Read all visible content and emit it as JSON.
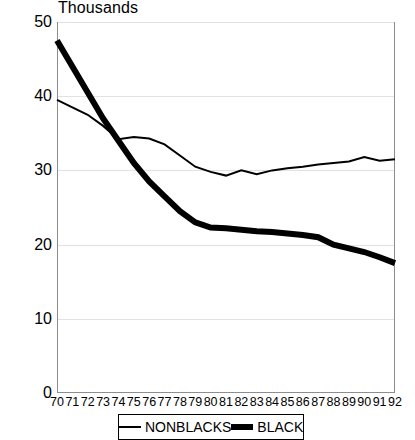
{
  "chart_data": {
    "type": "line",
    "title": "",
    "ylabel": "Thousands",
    "xlabel": "",
    "x": [
      70,
      71,
      72,
      73,
      74,
      75,
      76,
      77,
      78,
      79,
      80,
      81,
      82,
      83,
      84,
      85,
      86,
      87,
      88,
      89,
      90,
      91,
      92
    ],
    "xtick_labels": [
      "70",
      "71",
      "72",
      "73",
      "74",
      "75",
      "76",
      "77",
      "78",
      "79",
      "80",
      "81",
      "82",
      "83",
      "84",
      "85",
      "86",
      "87",
      "88",
      "89",
      "90",
      "91",
      "92"
    ],
    "ytick_labels": [
      "0",
      "10",
      "20",
      "30",
      "40",
      "50"
    ],
    "yticks": [
      0,
      10,
      20,
      30,
      40,
      50
    ],
    "ylim": [
      0,
      50
    ],
    "xlim": [
      70,
      92
    ],
    "grid": true,
    "legend_position": "bottom",
    "series": [
      {
        "name": "NONBLACKS",
        "style": "thin",
        "color": "#000000",
        "line_width": 2,
        "values": [
          39.5,
          38.5,
          37.5,
          36.0,
          34.2,
          34.5,
          34.3,
          33.5,
          32.0,
          30.5,
          29.8,
          29.3,
          30.0,
          29.5,
          30.0,
          30.3,
          30.5,
          30.8,
          31.0,
          31.2,
          31.8,
          31.3,
          31.5
        ]
      },
      {
        "name": "BLACKS",
        "style": "thick",
        "color": "#000000",
        "line_width": 6,
        "values": [
          47.5,
          44.0,
          40.5,
          37.0,
          34.0,
          31.0,
          28.5,
          26.5,
          24.5,
          23.0,
          22.3,
          22.2,
          22.0,
          21.8,
          21.7,
          21.5,
          21.3,
          21.0,
          20.0,
          19.5,
          19.0,
          18.3,
          17.5
        ]
      }
    ]
  },
  "legend": {
    "items": [
      {
        "label": "NONBLACKS",
        "style": "thin"
      },
      {
        "label": "BLACKS",
        "style": "thick"
      }
    ]
  },
  "plot_geometry": {
    "left": 57,
    "right": 395,
    "top": 22,
    "bottom": 393
  }
}
